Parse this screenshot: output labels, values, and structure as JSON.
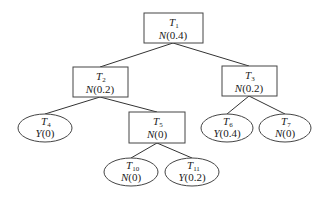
{
  "diagram": {
    "type": "decision-tree",
    "nodes": [
      {
        "id": "T1",
        "letter": "T",
        "sub": "1",
        "label_letter": "N",
        "value": "(0.4)",
        "shape": "rect",
        "x": 144,
        "y": 13,
        "w": 59,
        "h": 30
      },
      {
        "id": "T2",
        "letter": "T",
        "sub": "2",
        "label_letter": "N",
        "value": "(0.2)",
        "shape": "rect",
        "x": 73,
        "y": 67,
        "w": 55,
        "h": 30
      },
      {
        "id": "T3",
        "letter": "T",
        "sub": "3",
        "label_letter": "N",
        "value": "(0.2)",
        "shape": "rect",
        "x": 222,
        "y": 66,
        "w": 55,
        "h": 30
      },
      {
        "id": "T4",
        "letter": "T",
        "sub": "4",
        "label_letter": "Y",
        "value": "(0)",
        "shape": "ellipse",
        "cx": 45,
        "cy": 128,
        "rx": 27,
        "ry": 14
      },
      {
        "id": "T5",
        "letter": "T",
        "sub": "5",
        "label_letter": "N",
        "value": "(0)",
        "shape": "rect",
        "x": 129,
        "y": 112,
        "w": 56,
        "h": 31
      },
      {
        "id": "T6",
        "letter": "T",
        "sub": "6",
        "label_letter": "Y",
        "value": "(0.4)",
        "shape": "ellipse",
        "cx": 227,
        "cy": 128,
        "rx": 26,
        "ry": 14
      },
      {
        "id": "T7",
        "letter": "T",
        "sub": "7",
        "label_letter": "N",
        "value": "(0)",
        "shape": "ellipse",
        "cx": 285,
        "cy": 128,
        "rx": 26,
        "ry": 14
      },
      {
        "id": "T10",
        "letter": "T",
        "sub": "10",
        "label_letter": "N",
        "value": "(0)",
        "shape": "ellipse",
        "cx": 131,
        "cy": 172,
        "rx": 27,
        "ry": 14
      },
      {
        "id": "T11",
        "letter": "T",
        "sub": "11",
        "label_letter": "Y",
        "value": "(0.2)",
        "shape": "ellipse",
        "cx": 192,
        "cy": 172,
        "rx": 27,
        "ry": 14
      }
    ],
    "edges": [
      {
        "from": "T1",
        "to": "T2"
      },
      {
        "from": "T1",
        "to": "T3"
      },
      {
        "from": "T2",
        "to": "T4"
      },
      {
        "from": "T2",
        "to": "T5"
      },
      {
        "from": "T3",
        "to": "T6"
      },
      {
        "from": "T3",
        "to": "T7"
      },
      {
        "from": "T5",
        "to": "T10"
      },
      {
        "from": "T5",
        "to": "T11"
      }
    ]
  }
}
